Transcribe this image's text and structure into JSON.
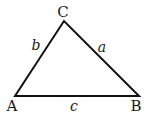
{
  "diagram": {
    "type": "triangle",
    "vertices": [
      {
        "id": "A",
        "label": "A",
        "x": 15,
        "y": 96
      },
      {
        "id": "B",
        "label": "B",
        "x": 139,
        "y": 96
      },
      {
        "id": "C",
        "label": "C",
        "x": 64,
        "y": 21
      }
    ],
    "sides": [
      {
        "id": "a",
        "label": "a",
        "between": [
          "B",
          "C"
        ]
      },
      {
        "id": "b",
        "label": "b",
        "between": [
          "A",
          "C"
        ]
      },
      {
        "id": "c",
        "label": "c",
        "between": [
          "A",
          "B"
        ]
      }
    ],
    "stroke_color": "#111111",
    "background": "#ffffff"
  }
}
